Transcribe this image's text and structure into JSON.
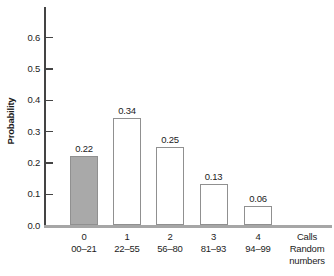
{
  "chart_data": {
    "type": "bar",
    "title": "",
    "ylabel": "Probability",
    "xlabel_calls": "Calls",
    "xlabel_random": "Random numbers",
    "categories_calls": [
      "0",
      "1",
      "2",
      "3",
      "4"
    ],
    "categories_random_numbers": [
      "00–21",
      "22–55",
      "56–80",
      "81–93",
      "94–99"
    ],
    "values": [
      0.22,
      0.34,
      0.25,
      0.13,
      0.06
    ],
    "value_labels": [
      "0.22",
      "0.34",
      "0.25",
      "0.13",
      "0.06"
    ],
    "yticks": [
      0.0,
      0.1,
      0.2,
      0.3,
      0.4,
      0.5,
      0.6
    ],
    "ytick_labels": [
      "0.0",
      "0.1",
      "0.2",
      "0.3",
      "0.4",
      "0.5",
      "0.6"
    ],
    "ylim": [
      0,
      0.65
    ],
    "grid": false,
    "legend": "none",
    "highlighted_bar_index": 0
  },
  "colors": {
    "background": "#ffffff",
    "highlight_bar_fill": "#a9a9a9",
    "bar_fill": "#ffffff",
    "bar_border": "#909090",
    "y_axis": "#444444",
    "x_baseline": "#a6a6a6",
    "text": "#1c1c1c"
  }
}
